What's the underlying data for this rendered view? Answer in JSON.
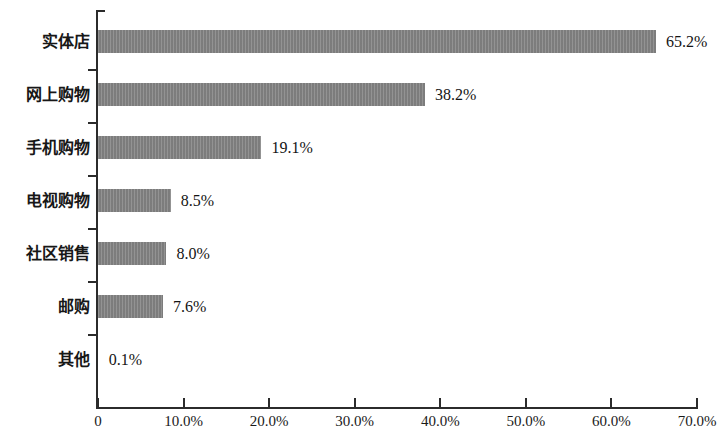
{
  "chart_data": {
    "type": "bar",
    "orientation": "horizontal",
    "title": "",
    "subtitle": "",
    "xlabel": "",
    "ylabel": "",
    "categories": [
      "实体店",
      "网上购物",
      "手机购物",
      "电视购物",
      "社区销售",
      "邮购",
      "其他"
    ],
    "values": [
      65.2,
      38.2,
      19.1,
      8.5,
      8.0,
      7.6,
      0.1
    ],
    "value_labels": [
      "65.2%",
      "38.2%",
      "19.1%",
      "8.5%",
      "8.0%",
      "7.6%",
      "0.1%"
    ],
    "xlim": [
      0,
      70
    ],
    "xtick_values": [
      0,
      10,
      20,
      30,
      40,
      50,
      60,
      70
    ],
    "xtick_labels": [
      "0",
      "10.0%",
      "20.0%",
      "30.0%",
      "40.0%",
      "50.0%",
      "60.0%",
      "70.0%"
    ],
    "grid": false,
    "legend": null,
    "series": [
      {
        "name": "",
        "values": [
          65.2,
          38.2,
          19.1,
          8.5,
          8.0,
          7.6,
          0.1
        ]
      }
    ],
    "bar_color": "#838383",
    "axis_color": "#2b2b2b",
    "background_color": "#ffffff"
  }
}
